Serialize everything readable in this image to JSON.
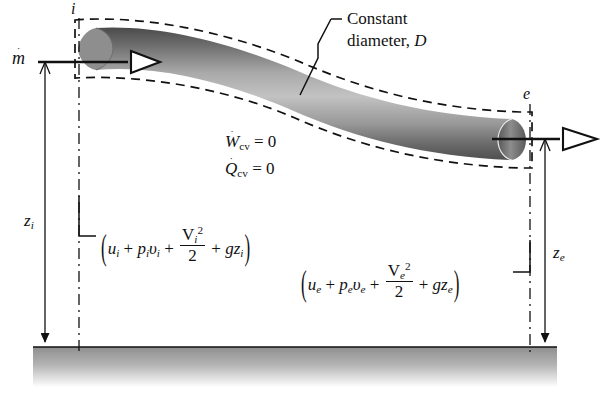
{
  "figure": {
    "type": "thermodynamics-control-volume-duct-diagram",
    "background_color": "#ffffff",
    "line_color": "#111111",
    "ground_color": "#8a8a8a"
  },
  "labels": {
    "inlet_station": "i",
    "exit_station": "e",
    "mass_flow": {
      "symbol": "m",
      "accent": "dot",
      "text": "ṁ"
    },
    "constant_diameter_line1": "Constant",
    "constant_diameter_line2": "diameter,",
    "constant_diameter_symbol": "D",
    "elevation_inlet": {
      "base": "z",
      "sub": "i"
    },
    "elevation_exit": {
      "base": "z",
      "sub": "e"
    }
  },
  "assumptions": [
    {
      "name": "work-rate",
      "base": "W",
      "accent": "dot",
      "sub": "cv",
      "value": "0",
      "text": "Ẇcv = 0"
    },
    {
      "name": "heat-rate",
      "base": "Q",
      "accent": "dot",
      "sub": "cv",
      "value": "0",
      "text": "Q̇cv = 0"
    }
  ],
  "energy_terms": {
    "inlet": {
      "station": "i",
      "internal_energy": "u",
      "flow_work": "pᵢυᵢ",
      "pressure": "p",
      "specific_volume": "υ",
      "kinetic_numerator": "V",
      "kinetic_exponent": "2",
      "kinetic_denominator": "2",
      "potential": "gz",
      "plus": "+",
      "text": "(uᵢ + pᵢυᵢ + Vᵢ²/2 + gzᵢ)"
    },
    "exit": {
      "station": "e",
      "internal_energy": "u",
      "flow_work": "pₑυₑ",
      "pressure": "p",
      "specific_volume": "υ",
      "kinetic_numerator": "V",
      "kinetic_exponent": "2",
      "kinetic_denominator": "2",
      "potential": "gz",
      "plus": "+",
      "text": "(uₑ + pₑυₑ + Vₑ²/2 + gzₑ)"
    }
  },
  "axis_symbols": {
    "g": "g",
    "V": "V",
    "u": "u",
    "p": "p",
    "v": "υ",
    "z": "z",
    "D": "D"
  }
}
